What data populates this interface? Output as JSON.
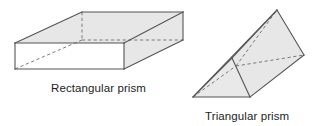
{
  "figure": {
    "background_color": "#ffffff",
    "stroke_color": "#555555",
    "hidden_edge_color": "#7a7a7a",
    "shaded_face_color": "#e7e7e7",
    "lit_face_color": "#ffffff",
    "shapes": [
      {
        "id": "rectangular-prism",
        "label": "Rectangular prism",
        "kind": "rectangular-prism",
        "faces": {
          "top": [
            [
              15,
              43
            ],
            [
              82,
              12
            ],
            [
              183,
              12
            ],
            [
              124,
              43
            ]
          ],
          "front": [
            [
              15,
              43
            ],
            [
              124,
              43
            ],
            [
              124,
              69
            ],
            [
              15,
              69
            ]
          ],
          "right": [
            [
              124,
              43
            ],
            [
              183,
              12
            ],
            [
              183,
              40
            ],
            [
              124,
              69
            ]
          ]
        },
        "visible_edges": [
          [
            [
              15,
              43
            ],
            [
              82,
              12
            ]
          ],
          [
            [
              82,
              12
            ],
            [
              183,
              12
            ]
          ],
          [
            [
              183,
              12
            ],
            [
              124,
              43
            ]
          ],
          [
            [
              124,
              43
            ],
            [
              15,
              43
            ]
          ],
          [
            [
              15,
              43
            ],
            [
              15,
              69
            ]
          ],
          [
            [
              15,
              69
            ],
            [
              124,
              69
            ]
          ],
          [
            [
              124,
              69
            ],
            [
              124,
              43
            ]
          ],
          [
            [
              183,
              12
            ],
            [
              183,
              40
            ]
          ],
          [
            [
              183,
              40
            ],
            [
              124,
              69
            ]
          ]
        ],
        "hidden_edges": [
          [
            [
              82,
              12
            ],
            [
              82,
              40
            ]
          ],
          [
            [
              82,
              40
            ],
            [
              183,
              40
            ]
          ],
          [
            [
              82,
              40
            ],
            [
              15,
              69
            ]
          ]
        ]
      },
      {
        "id": "triangular-prism",
        "label": "Triangular prism",
        "kind": "triangular-prism",
        "faces": {
          "front_triangle": [
            [
              193,
              97
            ],
            [
              250,
              97
            ],
            [
              232,
              58
            ]
          ],
          "top_rect": [
            [
              232,
              58
            ],
            [
              277,
              10
            ],
            [
              304,
              55
            ],
            [
              250,
              97
            ]
          ],
          "left_rect": [
            [
              193,
              97
            ],
            [
              232,
              58
            ],
            [
              277,
              10
            ],
            [
              236,
              66
            ]
          ]
        },
        "visible_edges": [
          [
            [
              193,
              97
            ],
            [
              250,
              97
            ]
          ],
          [
            [
              250,
              97
            ],
            [
              232,
              58
            ]
          ],
          [
            [
              232,
              58
            ],
            [
              193,
              97
            ]
          ],
          [
            [
              193,
              97
            ],
            [
              277,
              10
            ]
          ],
          [
            [
              277,
              10
            ],
            [
              304,
              55
            ]
          ],
          [
            [
              304,
              55
            ],
            [
              250,
              97
            ]
          ],
          [
            [
              232,
              58
            ],
            [
              277,
              10
            ]
          ]
        ],
        "hidden_edges": [
          [
            [
              193,
              97
            ],
            [
              236,
              66
            ]
          ],
          [
            [
              236,
              66
            ],
            [
              304,
              55
            ]
          ],
          [
            [
              236,
              66
            ],
            [
              277,
              10
            ]
          ]
        ]
      }
    ]
  }
}
